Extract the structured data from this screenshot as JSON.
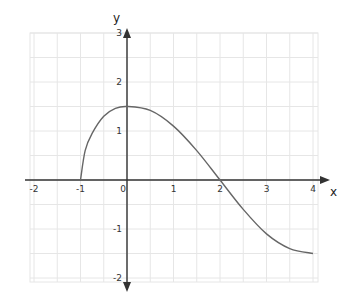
{
  "chart_data": {
    "type": "line",
    "title": "",
    "xlabel": "x",
    "ylabel": "y",
    "xlim": [
      -2.2,
      4.3
    ],
    "ylim": [
      -2.1,
      3.2
    ],
    "grid": true,
    "grid_step": 0.5,
    "x_ticks": [
      "-2",
      "-1",
      "0",
      "1",
      "2",
      "3",
      "4"
    ],
    "y_ticks": [
      "3",
      "2",
      "1",
      "-1",
      "-2"
    ],
    "series": [
      {
        "name": "f(x)",
        "color": "#666666",
        "x": [
          -1,
          -0.9,
          -0.75,
          -0.5,
          -0.25,
          0,
          0.5,
          1,
          1.5,
          2,
          2.5,
          3,
          3.5,
          4
        ],
        "y": [
          0,
          0.6,
          0.95,
          1.3,
          1.46,
          1.5,
          1.42,
          1.1,
          0.6,
          0,
          -0.6,
          -1.1,
          -1.4,
          -1.5
        ]
      }
    ],
    "key_points": [
      {
        "label": "x-intercept",
        "x": -1,
        "y": 0
      },
      {
        "label": "maximum",
        "x": 0,
        "y": 1.5
      },
      {
        "label": "x-intercept",
        "x": 2,
        "y": 0
      },
      {
        "label": "endpoint",
        "x": 4,
        "y": -1.5
      }
    ]
  },
  "labels": {
    "x_axis": "x",
    "y_axis": "y",
    "origin": "0"
  },
  "colors": {
    "axis": "#333333",
    "grid": "#e6e6e6",
    "curve": "#666666"
  }
}
